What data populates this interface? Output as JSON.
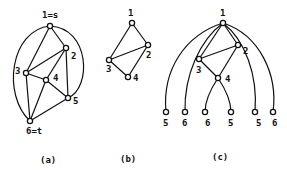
{
  "figures": [
    {
      "id": "a",
      "caption": "(a)",
      "nodes": [
        {
          "id": "1",
          "label": "1=s",
          "x": 50,
          "y": 26
        },
        {
          "id": "2",
          "label": "2",
          "x": 66,
          "y": 48
        },
        {
          "id": "3",
          "label": "3",
          "x": 26,
          "y": 73
        },
        {
          "id": "4",
          "label": "4",
          "x": 46,
          "y": 80
        },
        {
          "id": "5",
          "label": "5",
          "x": 68,
          "y": 98
        },
        {
          "id": "6",
          "label": "6=t",
          "x": 30,
          "y": 121
        }
      ],
      "edges": [
        [
          "1",
          "2"
        ],
        [
          "1",
          "3"
        ],
        [
          "2",
          "3"
        ],
        [
          "2",
          "4"
        ],
        [
          "4",
          "6"
        ],
        [
          "3",
          "4"
        ],
        [
          "4",
          "5"
        ],
        [
          "3",
          "6"
        ],
        [
          "6",
          "5"
        ],
        [
          "2",
          "5"
        ]
      ],
      "curved_edges": [
        [
          "1",
          "6"
        ],
        [
          "1",
          "5"
        ]
      ]
    },
    {
      "id": "b",
      "caption": "(b)",
      "nodes": [
        {
          "id": "1",
          "label": "1",
          "x": 132,
          "y": 23
        },
        {
          "id": "2",
          "label": "2",
          "x": 148,
          "y": 45
        },
        {
          "id": "3",
          "label": "3",
          "x": 109,
          "y": 60
        },
        {
          "id": "4",
          "label": "4",
          "x": 128,
          "y": 77
        }
      ],
      "edges": [
        [
          "1",
          "2"
        ],
        [
          "1",
          "3"
        ],
        [
          "2",
          "3"
        ],
        [
          "2",
          "4"
        ],
        [
          "3",
          "4"
        ]
      ]
    },
    {
      "id": "c",
      "caption": "(c)",
      "nodes": [
        {
          "id": "1",
          "label": "1",
          "x": 223,
          "y": 23
        },
        {
          "id": "2",
          "label": "2",
          "x": 238,
          "y": 45
        },
        {
          "id": "3",
          "label": "3",
          "x": 199,
          "y": 59
        },
        {
          "id": "4",
          "label": "4",
          "x": 218,
          "y": 78
        }
      ],
      "leaves": [
        {
          "label": "5",
          "x": 166,
          "y": 112
        },
        {
          "label": "6",
          "x": 185,
          "y": 112
        },
        {
          "label": "6",
          "x": 205,
          "y": 112
        },
        {
          "label": "5",
          "x": 231,
          "y": 112
        },
        {
          "label": "5",
          "x": 255,
          "y": 112
        },
        {
          "label": "6",
          "x": 273,
          "y": 112
        }
      ]
    }
  ]
}
